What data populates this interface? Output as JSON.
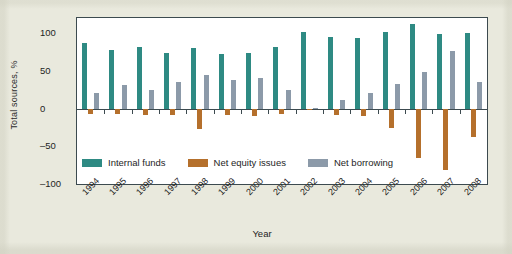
{
  "chart_data": {
    "type": "bar",
    "title": "",
    "xlabel": "Year",
    "ylabel": "Total sources, %",
    "categories": [
      "1994",
      "1995",
      "1996",
      "1997",
      "1998",
      "1999",
      "2000",
      "2001",
      "2002",
      "2003",
      "2004",
      "2005",
      "2006",
      "2007",
      "2008"
    ],
    "ylim": [
      -100,
      120
    ],
    "yticks": [
      100,
      50,
      0,
      -50,
      -100
    ],
    "ytick_labels": [
      "100",
      "50",
      "0",
      "–50",
      "–100"
    ],
    "grid": false,
    "legend_position": "inside-bottom-left",
    "series": [
      {
        "name": "Internal funds",
        "color": "#2e8a83",
        "values": [
          87,
          78,
          81,
          73,
          80,
          72,
          74,
          81,
          102,
          95,
          93,
          101,
          112,
          99,
          100
        ]
      },
      {
        "name": "Net equity issues",
        "color": "#b5702c",
        "values": [
          -7,
          -7,
          -8,
          -9,
          -27,
          -9,
          -10,
          -7,
          -2,
          -8,
          -10,
          -26,
          -65,
          -81,
          -38
        ]
      },
      {
        "name": "Net borrowing",
        "color": "#8c9aa9",
        "values": [
          21,
          31,
          25,
          35,
          45,
          38,
          40,
          24,
          1,
          11,
          21,
          32,
          49,
          76,
          35
        ]
      }
    ]
  },
  "axis": {
    "y_title": "Total sources, %",
    "x_title": "Year"
  }
}
